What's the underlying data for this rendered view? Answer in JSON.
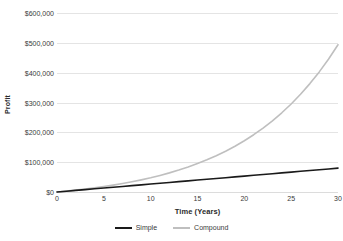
{
  "chart_data": {
    "type": "line",
    "title": "",
    "xlabel": "Time (Years)",
    "ylabel": "Profit",
    "xlim": [
      0,
      30
    ],
    "ylim": [
      0,
      600000
    ],
    "grid": true,
    "legend_position": "bottom-center",
    "x_tick_labels": [
      "0",
      "5",
      "10",
      "15",
      "20",
      "25",
      "30"
    ],
    "x_ticks": [
      0,
      5,
      10,
      15,
      20,
      25,
      30
    ],
    "y_tick_labels": [
      "$600,000",
      "$500,000",
      "$400,000",
      "$300,000",
      "$200,000",
      "$100,000",
      "$0"
    ],
    "y_ticks": [
      600000,
      500000,
      400000,
      300000,
      200000,
      100000,
      0
    ],
    "x": [
      0,
      1,
      2,
      3,
      4,
      5,
      6,
      7,
      8,
      9,
      10,
      11,
      12,
      13,
      14,
      15,
      16,
      17,
      18,
      19,
      20,
      21,
      22,
      23,
      24,
      25,
      26,
      27,
      28,
      29,
      30
    ],
    "series": [
      {
        "name": "Simple",
        "color": "#1a1a1a",
        "values": [
          0,
          2667,
          5333,
          8000,
          10667,
          13333,
          16000,
          18667,
          21333,
          24000,
          26667,
          29333,
          32000,
          34667,
          37333,
          40000,
          42667,
          45333,
          48000,
          50667,
          53333,
          56000,
          58667,
          61333,
          64000,
          66667,
          69333,
          72000,
          74667,
          77333,
          80000
        ]
      },
      {
        "name": "Compound",
        "color": "#bfbfbf",
        "values": [
          0,
          3000,
          6300,
          9930,
          13923,
          18315,
          23147,
          28462,
          34308,
          40738,
          47812,
          55593,
          64153,
          73568,
          83925,
          95317,
          107849,
          121634,
          136797,
          153477,
          171825,
          192007,
          214208,
          238629,
          265492,
          295041,
          327545,
          363300,
          402630,
          445893,
          493482
        ]
      }
    ]
  },
  "legend": {
    "items": [
      {
        "label": "Simple",
        "color": "#1a1a1a"
      },
      {
        "label": "Compound",
        "color": "#bfbfbf"
      }
    ]
  }
}
